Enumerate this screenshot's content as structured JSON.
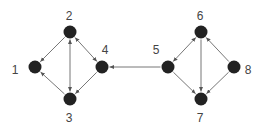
{
  "diagram": {
    "type": "directed-graph",
    "colors": {
      "node": "#222222",
      "edge": "#777777",
      "label": "#444444"
    },
    "nodes": [
      {
        "id": "1",
        "label": "1",
        "x": 35,
        "y": 67,
        "lx": 15,
        "ly": 70
      },
      {
        "id": "2",
        "label": "2",
        "x": 70,
        "y": 32,
        "lx": 69,
        "ly": 16
      },
      {
        "id": "3",
        "label": "3",
        "x": 70,
        "y": 99,
        "lx": 69,
        "ly": 118
      },
      {
        "id": "4",
        "label": "4",
        "x": 102,
        "y": 67,
        "lx": 105,
        "ly": 50
      },
      {
        "id": "5",
        "label": "5",
        "x": 168,
        "y": 67,
        "lx": 156,
        "ly": 50
      },
      {
        "id": "6",
        "label": "6",
        "x": 201,
        "y": 32,
        "lx": 200,
        "ly": 16
      },
      {
        "id": "7",
        "label": "7",
        "x": 201,
        "y": 99,
        "lx": 200,
        "ly": 118
      },
      {
        "id": "8",
        "label": "8",
        "x": 234,
        "y": 67,
        "lx": 248,
        "ly": 70
      }
    ],
    "edges": [
      {
        "from": "2",
        "to": "1",
        "bidirectional": false
      },
      {
        "from": "3",
        "to": "1",
        "bidirectional": false
      },
      {
        "from": "2",
        "to": "3",
        "bidirectional": true
      },
      {
        "from": "2",
        "to": "4",
        "bidirectional": true
      },
      {
        "from": "4",
        "to": "3",
        "bidirectional": false
      },
      {
        "from": "5",
        "to": "4",
        "bidirectional": false
      },
      {
        "from": "5",
        "to": "6",
        "bidirectional": true
      },
      {
        "from": "5",
        "to": "7",
        "bidirectional": false
      },
      {
        "from": "6",
        "to": "7",
        "bidirectional": false
      },
      {
        "from": "8",
        "to": "6",
        "bidirectional": false
      },
      {
        "from": "8",
        "to": "7",
        "bidirectional": false
      }
    ]
  }
}
